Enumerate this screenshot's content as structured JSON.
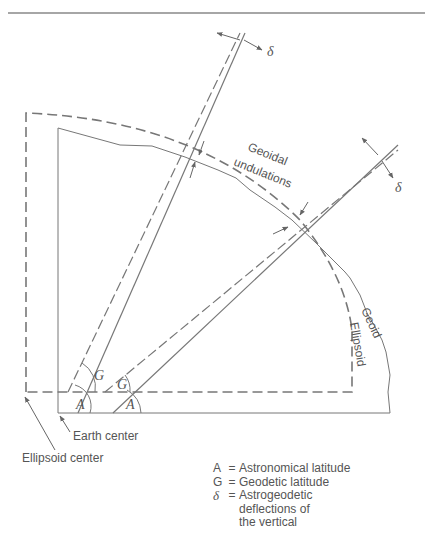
{
  "diagram": {
    "labels": {
      "geoidal_undulations_line1": "Geoidal",
      "geoidal_undulations_line2": "undulations",
      "geoid": "Geoid",
      "ellipsoid": "Ellipsoid",
      "earth_center": "Earth center",
      "ellipsoid_center": "Ellipsoid center",
      "delta_top": "δ",
      "delta_right": "δ",
      "angle_A_left": "A",
      "angle_A_right": "A",
      "angle_G_left": "G",
      "angle_G_right": "G"
    },
    "legend": [
      {
        "symbol": "A",
        "eq": "=",
        "text": "Astronomical latitude"
      },
      {
        "symbol": "G",
        "eq": "=",
        "text": "Geodetic latitude"
      },
      {
        "symbol": "δ",
        "eq": "=",
        "text": "Astrogeodetic\ndeflections of\nthe vertical"
      }
    ],
    "colors": {
      "line": "#777777",
      "text": "#555555"
    }
  }
}
